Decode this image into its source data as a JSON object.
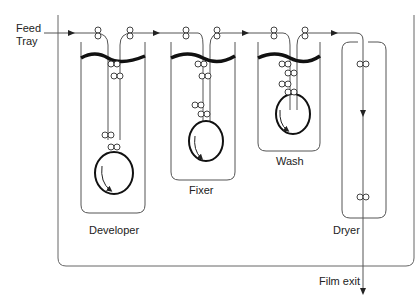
{
  "diagram": {
    "type": "film processor schematic",
    "labels": {
      "feed_tray_line1": "Feed",
      "feed_tray_line2": "Tray",
      "developer": "Developer",
      "fixer": "Fixer",
      "wash": "Wash",
      "dryer": "Dryer",
      "film_exit": "Film exit"
    },
    "stages": [
      {
        "name": "Developer",
        "has_drum": true
      },
      {
        "name": "Fixer",
        "has_drum": true
      },
      {
        "name": "Wash",
        "has_drum": true
      },
      {
        "name": "Dryer",
        "has_drum": false
      }
    ],
    "flow": [
      "Feed Tray",
      "Developer",
      "Fixer",
      "Wash",
      "Dryer",
      "Film exit"
    ],
    "colors": {
      "line": "#555555",
      "text": "#222222",
      "liquid": "#111111"
    }
  }
}
